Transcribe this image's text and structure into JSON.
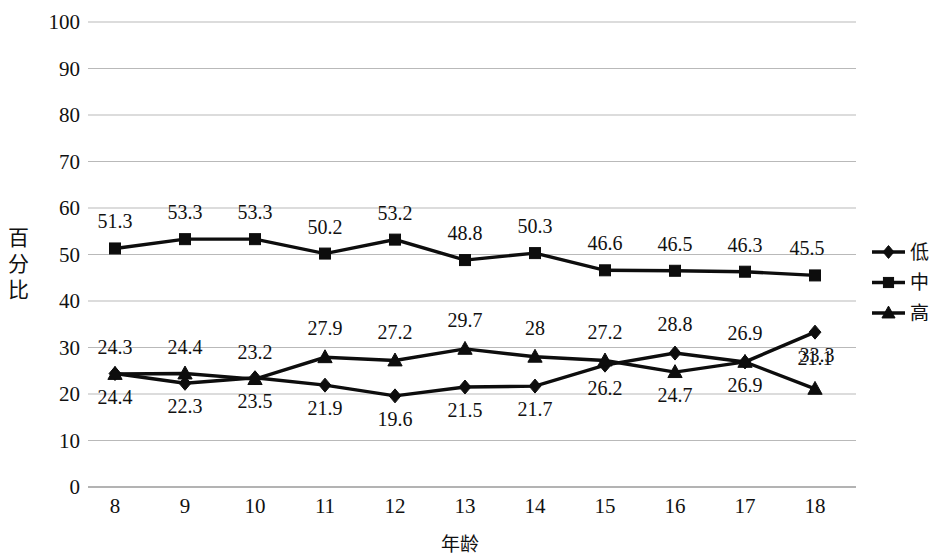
{
  "chart_data": {
    "type": "line",
    "title": "",
    "xlabel": "年龄",
    "ylabel": "百分比",
    "categories": [
      "8",
      "9",
      "10",
      "11",
      "12",
      "13",
      "14",
      "15",
      "16",
      "17",
      "18"
    ],
    "x": [
      8,
      9,
      10,
      11,
      12,
      13,
      14,
      15,
      16,
      17,
      18
    ],
    "ylim": [
      0,
      100
    ],
    "yticks": [
      "0",
      "10",
      "20",
      "30",
      "40",
      "50",
      "60",
      "70",
      "80",
      "90",
      "100"
    ],
    "ytick_values": [
      0,
      10,
      20,
      30,
      40,
      50,
      60,
      70,
      80,
      90,
      100
    ],
    "grid": true,
    "legend_position": "right",
    "series": [
      {
        "name": "低",
        "marker": "diamond",
        "values": [
          24.4,
          22.3,
          23.5,
          21.9,
          19.6,
          21.5,
          21.7,
          26.2,
          28.8,
          26.9,
          33.3
        ],
        "labels": [
          "24.4",
          "22.3",
          "23.5",
          "21.9",
          "19.6",
          "21.5",
          "21.7",
          "26.2",
          "28.8",
          "26.9",
          "33.3"
        ]
      },
      {
        "name": "中",
        "marker": "square",
        "values": [
          51.3,
          53.3,
          53.3,
          50.2,
          53.2,
          48.8,
          50.3,
          46.6,
          46.5,
          46.3,
          45.5
        ],
        "labels": [
          "51.3",
          "53.3",
          "53.3",
          "50.2",
          "53.2",
          "48.8",
          "50.3",
          "46.6",
          "46.5",
          "46.3",
          "45.5"
        ]
      },
      {
        "name": "高",
        "marker": "triangle",
        "values": [
          24.3,
          24.4,
          23.2,
          27.9,
          27.2,
          29.7,
          28.0,
          27.2,
          24.7,
          26.9,
          21.1
        ],
        "labels": [
          "24.3",
          "24.4",
          "23.2",
          "27.9",
          "27.2",
          "29.7",
          "28",
          "27.2",
          "24.7",
          "26.9",
          "21.1"
        ]
      }
    ],
    "colors": {
      "series": "#0d0d0d",
      "grid": "#b9b9b9",
      "background": "#ffffff"
    }
  },
  "legend": {
    "items": [
      {
        "label": "低",
        "marker": "diamond"
      },
      {
        "label": "中",
        "marker": "square"
      },
      {
        "label": "高",
        "marker": "triangle"
      }
    ]
  },
  "axes": {
    "y_title_chars": [
      "百",
      "分",
      "比"
    ],
    "x_title": "年龄"
  }
}
